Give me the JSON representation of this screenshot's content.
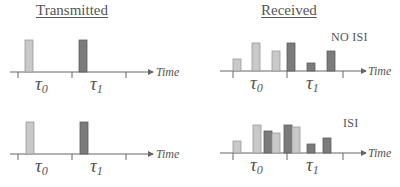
{
  "titles": {
    "transmitted": "Transmitted",
    "received": "Received"
  },
  "labels": {
    "no_isi": "NO ISI",
    "isi": "ISI",
    "time_axis": "Time",
    "symbol_0": "τ",
    "symbol_0_sub": "0",
    "symbol_1": "τ",
    "symbol_1_sub": "1"
  },
  "colors": {
    "light_pulse": "#c9c9c9",
    "light_pulse_border": "#9a9a9a",
    "dark_pulse": "#7b7b7b",
    "dark_pulse_border": "#5e5e5e",
    "axis": "#666666"
  },
  "panels": [
    {
      "id": "transmitted-top",
      "bars": [
        {
          "symbol": 0,
          "shade": "light",
          "height": "full"
        },
        {
          "symbol": 1,
          "shade": "dark",
          "height": "full"
        }
      ]
    },
    {
      "id": "received-no-isi",
      "caption": "NO ISI",
      "bars": [
        {
          "symbol": 0,
          "shade": "light",
          "height": "low"
        },
        {
          "symbol": 0,
          "shade": "light",
          "height": "high"
        },
        {
          "symbol": 0,
          "shade": "light",
          "height": "mid"
        },
        {
          "symbol": 1,
          "shade": "dark",
          "height": "high"
        },
        {
          "symbol": 1,
          "shade": "dark",
          "height": "min"
        },
        {
          "symbol": 1,
          "shade": "dark",
          "height": "mid"
        }
      ]
    },
    {
      "id": "transmitted-bottom",
      "bars": [
        {
          "symbol": 0,
          "shade": "light",
          "height": "full"
        },
        {
          "symbol": 1,
          "shade": "dark",
          "height": "full"
        }
      ]
    },
    {
      "id": "received-isi",
      "caption": "ISI",
      "bars": [
        {
          "symbol": 0,
          "shade": "light",
          "height": "low"
        },
        {
          "symbol": 0,
          "shade": "light",
          "height": "high"
        },
        {
          "symbol": 1,
          "shade": "dark",
          "height": "mid-high",
          "overlap": true
        },
        {
          "symbol": 0,
          "shade": "light",
          "height": "mid"
        },
        {
          "symbol": 1,
          "shade": "dark",
          "height": "high"
        },
        {
          "symbol": 0,
          "shade": "light",
          "height": "high",
          "overlap": true
        },
        {
          "symbol": 1,
          "shade": "dark",
          "height": "min"
        },
        {
          "symbol": 1,
          "shade": "dark",
          "height": "mid"
        }
      ]
    }
  ]
}
